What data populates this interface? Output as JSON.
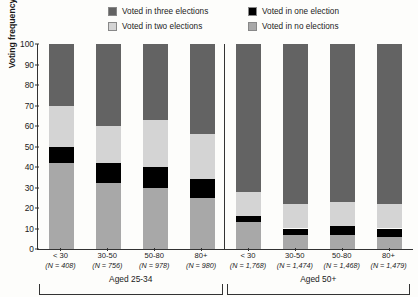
{
  "legend": {
    "items": [
      {
        "label": "Voted in three elections",
        "color": "#636363",
        "key": "three"
      },
      {
        "label": "Voted in one election",
        "color": "#000000",
        "key": "one"
      },
      {
        "label": "Voted in two elections",
        "color": "#d4d4d4",
        "key": "two"
      },
      {
        "label": "Voted in no elections",
        "color": "#a8a8a8",
        "key": "none"
      }
    ]
  },
  "chart_data": {
    "type": "bar",
    "subtype": "stacked-bar-100",
    "title": "",
    "xlabel": "",
    "ylabel": "Voting frequency (percent)",
    "ylim": [
      0,
      100
    ],
    "yticks": [
      0,
      10,
      20,
      30,
      40,
      50,
      60,
      70,
      80,
      90,
      100
    ],
    "grid": false,
    "legend_position": "top",
    "panels": [
      {
        "name": "Aged 25-34",
        "categories": [
          "< 30",
          "30-50",
          "50-80",
          "80+"
        ],
        "n_labels": [
          "(N = 408)",
          "(N = 756)",
          "(N = 978)",
          "(N = 980)"
        ],
        "n_values": [
          408,
          756,
          978,
          980
        ],
        "series": [
          {
            "name": "Voted in no elections",
            "color": "#a8a8a8",
            "values": [
              42,
              32,
              30,
              25
            ]
          },
          {
            "name": "Voted in one election",
            "color": "#000000",
            "values": [
              8,
              10,
              10,
              9
            ]
          },
          {
            "name": "Voted in two elections",
            "color": "#d4d4d4",
            "values": [
              20,
              18,
              23,
              22
            ]
          },
          {
            "name": "Voted in three elections",
            "color": "#636363",
            "values": [
              30,
              40,
              37,
              44
            ]
          }
        ]
      },
      {
        "name": "Aged 50+",
        "categories": [
          "< 30",
          "30-50",
          "50-80",
          "80+"
        ],
        "n_labels": [
          "(N = 1,768)",
          "(N = 1,474)",
          "(N = 1,468)",
          "(N = 1,479)"
        ],
        "n_values": [
          1768,
          1474,
          1468,
          1479
        ],
        "series": [
          {
            "name": "Voted in no elections",
            "color": "#a8a8a8",
            "values": [
              13,
              7,
              7,
              6
            ]
          },
          {
            "name": "Voted in one election",
            "color": "#000000",
            "values": [
              3,
              3,
              4,
              4
            ]
          },
          {
            "name": "Voted in two elections",
            "color": "#d4d4d4",
            "values": [
              12,
              12,
              12,
              12
            ]
          },
          {
            "name": "Voted in three elections",
            "color": "#636363",
            "values": [
              72,
              78,
              77,
              78
            ]
          }
        ]
      }
    ]
  }
}
